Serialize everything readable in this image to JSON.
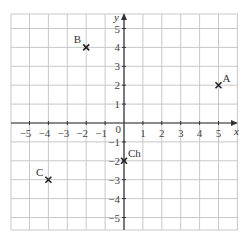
{
  "diagram": {
    "type": "coordinate-grid",
    "x_axis_label": "x",
    "y_axis_label": "y",
    "origin_label": "0",
    "x_range": [
      -6,
      6
    ],
    "y_range": [
      -6,
      6
    ],
    "x_ticks": [
      {
        "v": -5,
        "label": "−5"
      },
      {
        "v": -4,
        "label": "−4"
      },
      {
        "v": -3,
        "label": "−3"
      },
      {
        "v": -2,
        "label": "−2"
      },
      {
        "v": -1,
        "label": "−1"
      },
      {
        "v": 1,
        "label": "1"
      },
      {
        "v": 2,
        "label": "2"
      },
      {
        "v": 3,
        "label": "3"
      },
      {
        "v": 4,
        "label": "4"
      },
      {
        "v": 5,
        "label": "5"
      }
    ],
    "y_ticks": [
      {
        "v": 5,
        "label": "5"
      },
      {
        "v": 4,
        "label": "4"
      },
      {
        "v": 3,
        "label": "3"
      },
      {
        "v": 2,
        "label": "2"
      },
      {
        "v": 1,
        "label": "1"
      },
      {
        "v": -1,
        "label": "−1"
      },
      {
        "v": -2,
        "label": "−2"
      },
      {
        "v": -3,
        "label": "−3"
      },
      {
        "v": -4,
        "label": "−4"
      },
      {
        "v": -5,
        "label": "−5"
      }
    ],
    "points": [
      {
        "name": "A",
        "x": 5,
        "y": 2
      },
      {
        "name": "B",
        "x": -2,
        "y": 4
      },
      {
        "name": "C",
        "x": -4,
        "y": -3
      },
      {
        "name": "Ch",
        "x": 0,
        "y": -2
      }
    ],
    "colors": {
      "grid": "#c8c8c8",
      "axis": "#333333",
      "marker": "#222222"
    }
  }
}
